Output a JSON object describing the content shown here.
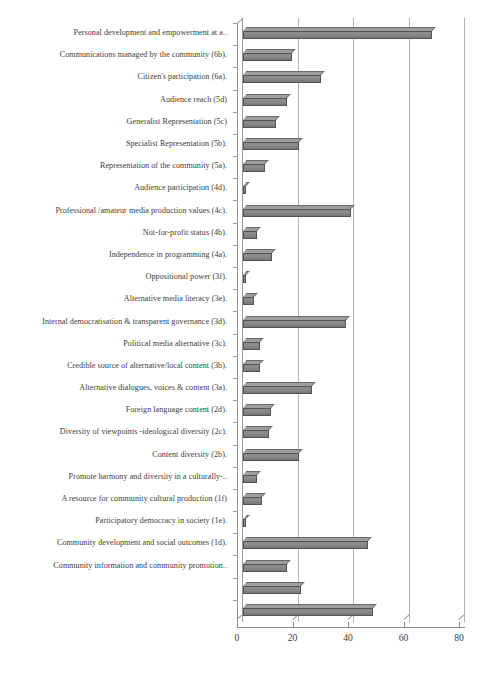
{
  "chart_data": {
    "type": "bar",
    "orientation": "horizontal",
    "title": "",
    "xlabel": "",
    "ylabel": "",
    "xlim": [
      0,
      80
    ],
    "xticks": [
      0,
      20,
      40,
      60,
      80
    ],
    "xtick_labels": [
      "0",
      "20",
      "40",
      "60",
      "80"
    ],
    "grid": true,
    "legend": false,
    "style": "3d-bar",
    "bar_color": "#8a8a8a",
    "bar_edge_color": "#545454",
    "categories": [
      "Personal development and empowerment at a..",
      "Communications managed by the community (6b).",
      "Citizen's participation (6a).",
      "Audience reach (5d)",
      "Generalist Representation (5c)",
      "Specialist Representation (5b).",
      "Representation of the community (5a).",
      "Audience participation (4d).",
      "Professional /amateur media production values (4c).",
      "Not-for-profit status (4b).",
      "Independence in programming (4a).",
      "Oppositional power (3f).",
      "Alternative media literacy (3e).",
      "Internal democratisation & transparent governance (3d).",
      "Political media alternative (3c).",
      "Credible source of alternative/local content (3b).",
      "Alternative  dialogues, voices & content (3a).",
      "Foreign language content (2d).",
      "Diversity of viewpoints -ideological diversity (2c).",
      "Content diversity (2b).",
      "Promote harmony and diversity in a culturally-..",
      "A resource for community cultural production (1f)",
      "Participatory democracy in society (1e).",
      "Community development and  social outcomes (1d).",
      "Community information and community promotion..",
      "",
      ""
    ],
    "values": [
      68,
      17.5,
      28,
      16,
      12,
      20,
      8,
      1,
      39,
      5,
      10.5,
      1,
      4,
      37,
      6,
      6,
      25,
      10,
      9.5,
      20,
      5,
      7,
      1,
      45,
      16,
      21,
      47
    ]
  }
}
